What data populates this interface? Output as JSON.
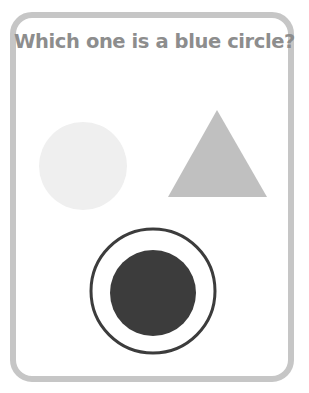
{
  "question": {
    "text": "Which one is a blue circle?"
  },
  "options": [
    {
      "id": "light-circle",
      "shape": "circle",
      "color": "#efefef",
      "selected": false
    },
    {
      "id": "gray-triangle",
      "shape": "triangle",
      "color": "#c0c0c0",
      "selected": false
    },
    {
      "id": "dark-circle",
      "shape": "circle",
      "color": "#3c3c3c",
      "selected": true,
      "ring_color": "#3c3c3c"
    }
  ],
  "colors": {
    "card_border": "#c6c6c6",
    "question_text": "#8d8d8d",
    "background": "#ffffff"
  }
}
